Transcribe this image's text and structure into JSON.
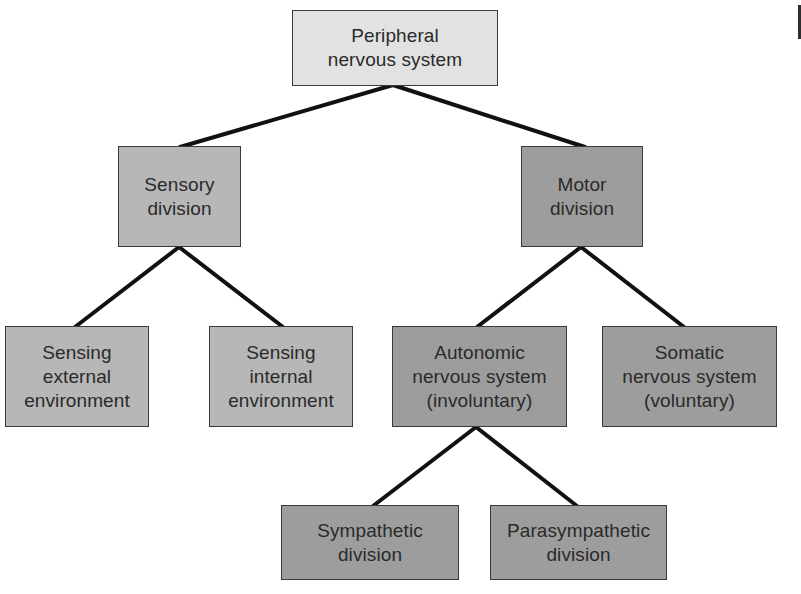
{
  "diagram": {
    "type": "hierarchy-tree",
    "colors": {
      "root_fill": "#e2e2e2",
      "sensory_fill": "#b7b7b7",
      "motor_fill": "#9d9d9d",
      "border": "#3a3a3a",
      "connector": "#111111",
      "text": "#2a2a2a"
    },
    "nodes": {
      "root": {
        "line1": "Peripheral",
        "line2": "nervous system"
      },
      "sensory": {
        "line1": "Sensory",
        "line2": "division"
      },
      "motor": {
        "line1": "Motor",
        "line2": "division"
      },
      "sensing_external": {
        "line1": "Sensing",
        "line2": "external",
        "line3": "environment"
      },
      "sensing_internal": {
        "line1": "Sensing",
        "line2": "internal",
        "line3": "environment"
      },
      "autonomic": {
        "line1": "Autonomic",
        "line2": "nervous system",
        "line3": "(involuntary)"
      },
      "somatic": {
        "line1": "Somatic",
        "line2": "nervous system",
        "line3": "(voluntary)"
      },
      "sympathetic": {
        "line1": "Sympathetic",
        "line2": "division"
      },
      "parasympathetic": {
        "line1": "Parasympathetic",
        "line2": "division"
      }
    },
    "edges": [
      [
        "root",
        "sensory"
      ],
      [
        "root",
        "motor"
      ],
      [
        "sensory",
        "sensing_external"
      ],
      [
        "sensory",
        "sensing_internal"
      ],
      [
        "motor",
        "autonomic"
      ],
      [
        "motor",
        "somatic"
      ],
      [
        "autonomic",
        "sympathetic"
      ],
      [
        "autonomic",
        "parasympathetic"
      ]
    ]
  }
}
